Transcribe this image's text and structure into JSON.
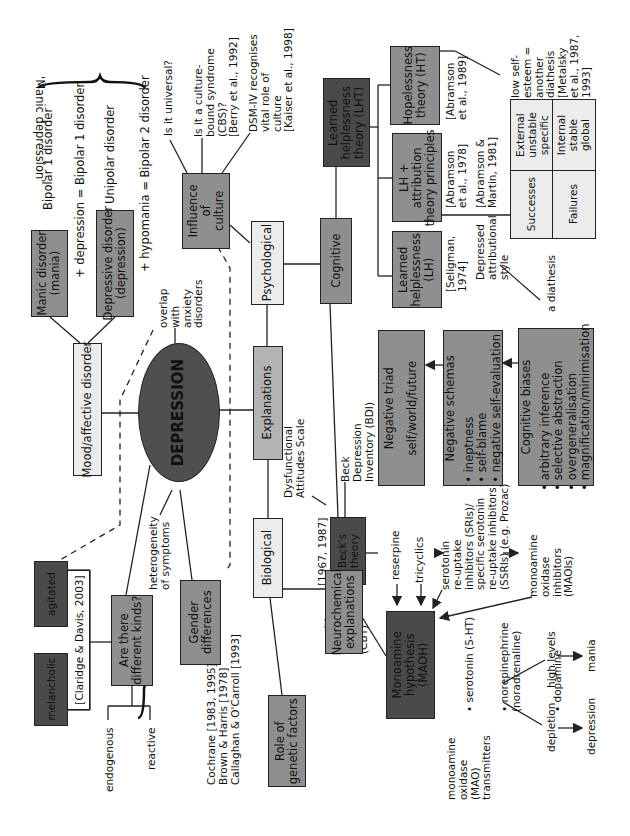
{
  "center": {
    "label": "DEPRESSION"
  },
  "mood": {
    "label": "Mood/affective disorder",
    "manic_box": "Manic disorder\n(mania)",
    "depressive_box": "Depressive disorder\n(depression)",
    "bipolar1": "Bipolar 1 disorder",
    "plus_depression": "+ depression = Bipolar 1 disorder",
    "unipolar": "Unipolar disorder",
    "plus_hypomania": "+ hypomania = Bipolar 2 disorder",
    "manic_depression": "'Manic depression'"
  },
  "overlap": "overlap\nwith\nanxiety\ndisorders",
  "heterogeneity": "heterogeneity\nof symptoms",
  "kinds": {
    "label": "Are there\ndifferent kinds?",
    "citation": "[Claridge & Davis, 2003]",
    "melancholic": "melancholic",
    "agitated": "agitated",
    "endogenous": "endogenous",
    "reactive": "reactive"
  },
  "gender": {
    "label": "Gender\ndifferences",
    "citations": "Cochrane [1983, 1995]\nBrown & Harris [1978]\nCallaghan & O'Carroll [1993]"
  },
  "explanations": {
    "label": "Explanations"
  },
  "psychological": {
    "label": "Psychological"
  },
  "culture": {
    "label": "Influence\nof\nculture",
    "universal": "Is it universal?",
    "cbs": "Is it a culture-\nbound syndrome\n(CBS)?\n[Berry et al., 1992]",
    "dsm": "DSM-IV recognises\nvital role of\nculture\n[Kaiser et al., 1998]"
  },
  "cognitive": {
    "label": "Cognitive",
    "lht": "Learned\nhelplessness\ntheory (LHT)",
    "lh": "Learned\nhelplessness\n(LH)",
    "lh_cite": "[Seligman,\n1974]",
    "lh_attr": "LH +\nattribution\ntheory principles",
    "lh_attr_cite": "[Abramson\net al., 1978]",
    "abramson_martin": "[Abramson &\nMartin, 1981]",
    "ht": "Hopelessness\ntheory (HT)",
    "ht_cite": "[Abramson\net al., 1989]",
    "self_esteem": "low self-\nesteem =\nanother\ndiathesis\n[Metalsky\net al., 1987,\n1993]",
    "depressed_style": "Depressed\nattributional\nstyle",
    "diathesis": "a diathesis",
    "table": {
      "rows": [
        {
          "label": "Successes",
          "value": "External\nunstable\nspecific"
        },
        {
          "label": "Failures",
          "value": "Internal\nstable\nglobal"
        }
      ]
    }
  },
  "beck": {
    "label": "Beck's\ntheory",
    "years": "[1967, 1987]",
    "das": "Dysfunctional\nAttitudes Scale",
    "bdi": "Beck\nDepression\nInventory (BDI)",
    "cbt": "cognitive\nbehaviour\ntherapy\n(CBT)",
    "triad_title": "Negative triad",
    "triad_sub": "self/world/future",
    "schemas_title": "Negative schemas",
    "schemas_items": [
      "ineptness",
      "self-blame",
      "negative self-evaluation"
    ],
    "biases_title": "Cognitive biases",
    "biases_items": [
      "arbitrary inference",
      "selective abstraction",
      "overgeneralisation",
      "magnification/minimisation"
    ]
  },
  "biological": {
    "label": "Biological",
    "genetic": "Role of\ngenetic factors",
    "neuro": "Neurochemical\nexplanations",
    "maoh": "Monoamine\nhypothesis\n(MAOH)",
    "reserpine": "reserpine",
    "tricyclics": "tricyclics",
    "ssri": "serotonin\nre-uptake\ninhibitors (SRIs)/\nspecific serotonin\nre-uptake inhibitors\n(SSRIs) (e.g. Prozac)",
    "maoi": "monoamine\noxidase\ninhibitors\n(MAOIs)",
    "transmitters": [
      "serotonin (5-HT)",
      "norepinephrine\n(noradrenaline)",
      "dopamine"
    ],
    "mao_label": "monoamine\noxidase\n(MAO)\ntransmitters",
    "high_levels": "high levels",
    "mania": "mania",
    "depletion": "depletion",
    "depression": "depression"
  }
}
